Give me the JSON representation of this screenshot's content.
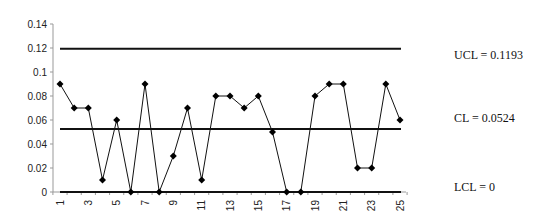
{
  "chart_data": {
    "type": "line",
    "title": "",
    "xlabel": "",
    "ylabel": "",
    "x": [
      1,
      2,
      3,
      4,
      5,
      6,
      7,
      8,
      9,
      10,
      11,
      12,
      13,
      14,
      15,
      16,
      17,
      18,
      19,
      20,
      21,
      22,
      23,
      24,
      25
    ],
    "x_tick_labels": [
      "1",
      "3",
      "5",
      "7",
      "9",
      "11",
      "13",
      "15",
      "17",
      "19",
      "21",
      "23",
      "25"
    ],
    "series": [
      {
        "name": "p",
        "values": [
          0.09,
          0.07,
          0.07,
          0.01,
          0.06,
          0,
          0.09,
          0,
          0.03,
          0.07,
          0.01,
          0.08,
          0.08,
          0.07,
          0.08,
          0.05,
          0,
          0,
          0.08,
          0.09,
          0.09,
          0.02,
          0.02,
          0.09,
          0.06
        ]
      }
    ],
    "y_ticks": [
      0,
      0.02,
      0.04,
      0.06,
      0.08,
      0.1,
      0.12,
      0.14
    ],
    "y_tick_labels": [
      "0",
      "0.02",
      "0.04",
      "0.06",
      "0.08",
      "0.1",
      "0.12",
      "0.14"
    ],
    "ylim": [
      0,
      0.14
    ],
    "control_lines": [
      {
        "name": "UCL",
        "value": 0.1193,
        "label": "UCL = 0.1193"
      },
      {
        "name": "CL",
        "value": 0.0524,
        "label": "CL = 0.0524"
      },
      {
        "name": "LCL",
        "value": 0,
        "label": "LCL = 0"
      }
    ],
    "grid": false,
    "legend": "none",
    "marker": "diamond"
  },
  "labels": {
    "ucl": "UCL = 0.1193",
    "cl": "CL = 0.0524",
    "lcl": "LCL = 0"
  }
}
